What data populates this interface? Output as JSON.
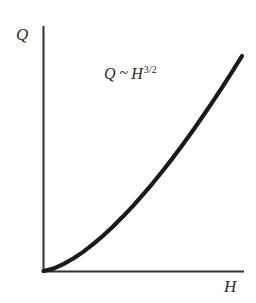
{
  "figure": {
    "background_color": "#ffffff",
    "axis_color": "#303030",
    "curve_color": "#1a1a1a",
    "ylabel": "Q",
    "xlabel": "H",
    "annotation": {
      "base": "Q",
      "relation": "~",
      "variable": "H",
      "exponent": "3/2",
      "full_text": "Q ~ H3/2"
    }
  },
  "chart_data": {
    "type": "line",
    "title": "",
    "subtitle": "",
    "xlabel": "H",
    "ylabel": "Q",
    "annotations": [
      "Q ~ H3/2"
    ],
    "legend": [],
    "legend_position": "none",
    "grid": false,
    "ticks": false,
    "tick_labels": [],
    "xlim": [
      0,
      1
    ],
    "ylim": [
      0,
      1
    ],
    "relationship": "Q proportional to H^(3/2)",
    "exponent": 1.5,
    "series": [
      {
        "name": "Q ~ H3/2",
        "color": "#1a1a1a",
        "x": [
          0.0,
          0.05,
          0.1,
          0.15,
          0.2,
          0.25,
          0.3,
          0.35,
          0.4,
          0.45,
          0.5,
          0.55,
          0.6,
          0.65,
          0.7,
          0.75,
          0.8,
          0.85,
          0.9,
          0.95,
          1.0
        ],
        "y": [
          0.0,
          0.011,
          0.032,
          0.058,
          0.089,
          0.125,
          0.164,
          0.207,
          0.253,
          0.302,
          0.354,
          0.408,
          0.465,
          0.524,
          0.586,
          0.65,
          0.716,
          0.784,
          0.854,
          0.926,
          1.0
        ]
      }
    ]
  }
}
